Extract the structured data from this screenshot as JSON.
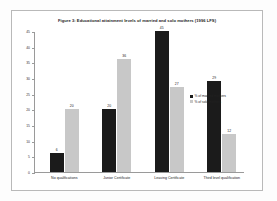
{
  "chart_data": {
    "type": "bar",
    "title": "Figure 3: Educational attainment levels of married and solo mothers (1996 LFS)",
    "xlabel": "",
    "ylabel": "",
    "ylim": [
      0,
      45
    ],
    "yticks": [
      0,
      5,
      10,
      15,
      20,
      25,
      30,
      35,
      40,
      45
    ],
    "ytick_labels": [
      "0",
      "5",
      "10",
      "15",
      "20",
      "25",
      "30",
      "35",
      "40",
      "45"
    ],
    "grid": false,
    "legend_position": "right",
    "categories": [
      "No qualifications",
      "Junior Certificate",
      "Leaving Certificate",
      "Third level qualification"
    ],
    "series": [
      {
        "name": "% of married mothers",
        "color": "#1b1b1b",
        "values": [
          6,
          20,
          45,
          29
        ]
      },
      {
        "name": "% of solo mothers",
        "color": "#c8c8c8",
        "values": [
          20,
          36,
          27,
          12
        ]
      }
    ]
  }
}
